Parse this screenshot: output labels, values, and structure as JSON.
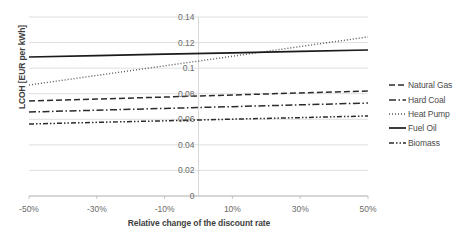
{
  "chart_data": {
    "type": "line",
    "title": "",
    "xlabel": "Relative change of the discount rate",
    "ylabel": "LCOH [EUR per kWh]",
    "x": [
      -50,
      -30,
      -10,
      10,
      30,
      50
    ],
    "x_tick_labels": [
      "-50%",
      "-30%",
      "-10%",
      "10%",
      "30%",
      "50%"
    ],
    "xlim": [
      -50,
      50
    ],
    "ylim": [
      0,
      0.14
    ],
    "y_ticks": [
      0,
      0.02,
      0.04,
      0.06,
      0.08,
      0.1,
      0.12,
      0.14
    ],
    "y_tick_labels": [
      "0",
      "0.02",
      "0.04",
      "0.06",
      "0.08",
      "0.1",
      "0.12",
      "0.14"
    ],
    "grid": true,
    "legend_position": "right",
    "series": [
      {
        "name": "Natural Gas",
        "style": "dashed",
        "color": "#2b2b2b",
        "values": [
          0.0743,
          0.0758,
          0.0774,
          0.079,
          0.0806,
          0.0821
        ]
      },
      {
        "name": "Hard Coal",
        "style": "dash-dot",
        "color": "#2b2b2b",
        "values": [
          0.0657,
          0.0671,
          0.0685,
          0.0699,
          0.0713,
          0.0727
        ]
      },
      {
        "name": "Heat Pump",
        "style": "dotted",
        "color": "#555555",
        "values": [
          0.0868,
          0.0943,
          0.1018,
          0.1093,
          0.1169,
          0.1244
        ]
      },
      {
        "name": "Fuel Oil",
        "style": "solid",
        "color": "#1a1a1a",
        "values": [
          0.1087,
          0.1098,
          0.1109,
          0.112,
          0.1131,
          0.1142
        ]
      },
      {
        "name": "Biomass",
        "style": "dash-dot-dot",
        "color": "#2b2b2b",
        "values": [
          0.0563,
          0.0576,
          0.0588,
          0.0601,
          0.0613,
          0.0626
        ]
      }
    ]
  },
  "legend": {
    "items": [
      {
        "label": "Natural Gas"
      },
      {
        "label": "Hard Coal"
      },
      {
        "label": "Heat Pump"
      },
      {
        "label": "Fuel Oil"
      },
      {
        "label": "Biomass"
      }
    ]
  }
}
